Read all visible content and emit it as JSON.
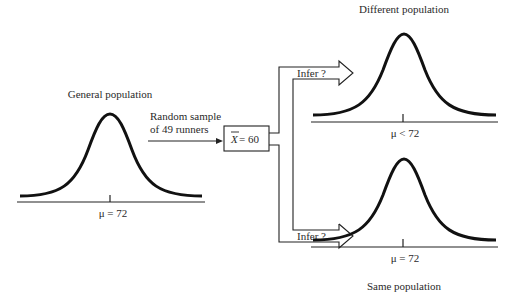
{
  "diagram": {
    "general": {
      "title": "General population",
      "mean_label": "μ = 72"
    },
    "sample": {
      "line1": "Random sample",
      "line2": "of 49 runners",
      "stat_symbol": "X",
      "stat_value": " = 60"
    },
    "inference": {
      "upper_label": "Infer ?",
      "lower_label": "Infer ?"
    },
    "different": {
      "title": "Different population",
      "mean_label": "μ < 72"
    },
    "same": {
      "title": "Same population",
      "mean_label": "μ = 72"
    }
  }
}
